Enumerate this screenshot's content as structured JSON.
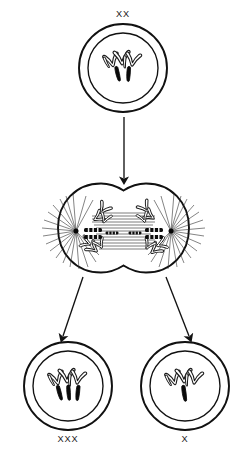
{
  "diagram": {
    "type": "biological-process-diagram",
    "background_color": "#ffffff",
    "line_color": "#111111",
    "chromosome_outline_color": "#1a1a1a",
    "chromosome_solid_color": "#0a0a0a",
    "label_color": "#1a1a1a"
  },
  "stages": {
    "parent": {
      "stage_name": "parent-cell",
      "label": "XX",
      "label_position": "above",
      "cell_center": {
        "x": 123,
        "y": 68
      },
      "membrane_radius": 44,
      "nucleus_radius": 35,
      "sex_chromosome_count": 2,
      "sex_chromosome_style": "solid",
      "autosome_count": 4,
      "autosome_style": "outline"
    },
    "dividing": {
      "stage_name": "dividing-cell-anaphase",
      "label": "",
      "left_lobe_center": {
        "x": 86,
        "y": 228
      },
      "right_lobe_center": {
        "x": 161,
        "y": 228
      },
      "lobe_radius": 45,
      "pole_count": 2,
      "left_pole": {
        "x": 76,
        "y": 231
      },
      "right_pole": {
        "x": 171,
        "y": 231
      },
      "spindle_fiber_count": 13,
      "astral_fiber_count_per_pole": 19,
      "chromosome_sets": 2
    },
    "daughter_left": {
      "stage_name": "daughter-cell-trisomy",
      "label": "XXX",
      "label_position": "below",
      "cell_center": {
        "x": 68,
        "y": 386
      },
      "membrane_radius": 44,
      "nucleus_radius": 35,
      "sex_chromosome_count": 3,
      "sex_chromosome_style": "solid",
      "autosome_count": 4,
      "autosome_style": "outline"
    },
    "daughter_right": {
      "stage_name": "daughter-cell-monosomy",
      "label": "X",
      "label_position": "below",
      "cell_center": {
        "x": 185,
        "y": 386
      },
      "membrane_radius": 44,
      "nucleus_radius": 35,
      "sex_chromosome_count": 1,
      "sex_chromosome_style": "solid",
      "autosome_count": 4,
      "autosome_style": "outline"
    }
  },
  "arrows": [
    {
      "name": "arrow-parent-to-dividing",
      "direction": "down",
      "from_stage": "parent",
      "to_stage": "dividing",
      "x1": 124,
      "y1": 117,
      "x2": 124,
      "y2": 180
    },
    {
      "name": "arrow-dividing-to-left-daughter",
      "direction": "down-left",
      "from_stage": "dividing",
      "to_stage": "daughter_left",
      "x1": 82,
      "y1": 276,
      "x2": 62,
      "y2": 338
    },
    {
      "name": "arrow-dividing-to-right-daughter",
      "direction": "down-right",
      "from_stage": "dividing",
      "to_stage": "daughter_right",
      "x1": 167,
      "y1": 276,
      "x2": 190,
      "y2": 338
    }
  ],
  "labels": {
    "parent_genotype": "XX",
    "daughter_left_genotype": "XXX",
    "daughter_right_genotype": "X"
  }
}
